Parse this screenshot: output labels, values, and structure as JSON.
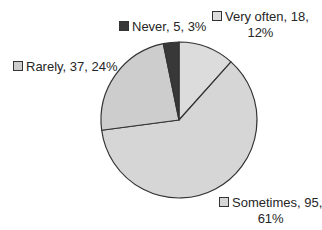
{
  "chart_data": {
    "type": "pie",
    "title": "",
    "start_angle_deg": 0,
    "direction": "clockwise",
    "slices": [
      {
        "label": "Very often",
        "value": 18,
        "percent": 12,
        "color": "#dcdcdc",
        "display": "Very often, 18,",
        "display2": "12%"
      },
      {
        "label": "Sometimes",
        "value": 95,
        "percent": 61,
        "color": "#d6d6d6",
        "display": "Sometimes, 95,",
        "display2": "61%"
      },
      {
        "label": "Rarely",
        "value": 37,
        "percent": 24,
        "color": "#cdcdcd",
        "display": "Rarely, 37, 24%",
        "display2": ""
      },
      {
        "label": "Never",
        "value": 5,
        "percent": 3,
        "color": "#383838",
        "display": "Never, 5, 3%",
        "display2": ""
      }
    ],
    "categories": [
      "Very often",
      "Sometimes",
      "Rarely",
      "Never"
    ],
    "values": [
      18,
      95,
      37,
      5
    ],
    "percentages": [
      12,
      61,
      24,
      3
    ],
    "legend": "data labels with color swatch beside each slice",
    "outline_color": "#333333"
  }
}
